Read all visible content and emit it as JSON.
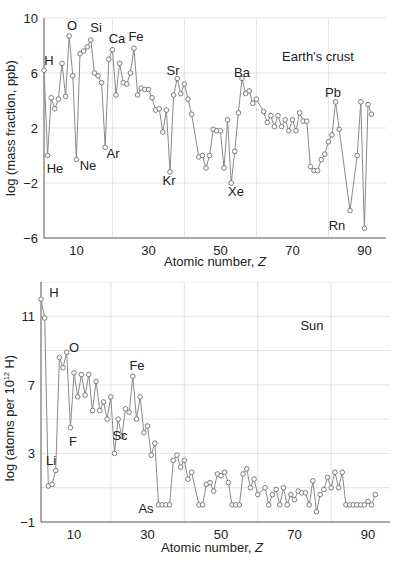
{
  "chart_data": [
    {
      "type": "line",
      "title": "Earth's crust",
      "xlabel": "Atomic number, Z",
      "ylabel": "log (mass fraction, ppb)",
      "xlim": [
        1,
        96
      ],
      "ylim": [
        -6,
        10
      ],
      "xticks": [
        10,
        30,
        50,
        70,
        90
      ],
      "yticks": [
        -6,
        -2,
        2,
        6,
        10
      ],
      "grid": true,
      "annotations": [
        "H",
        "He",
        "O",
        "Ne",
        "Si",
        "Ar",
        "Ca",
        "Fe",
        "Sr",
        "Kr",
        "Ba",
        "Xe",
        "Pb",
        "Rn"
      ],
      "series": [
        {
          "name": "Earth's crust",
          "x": [
            1,
            2,
            3,
            4,
            5,
            6,
            7,
            8,
            9,
            10,
            11,
            12,
            13,
            14,
            15,
            16,
            17,
            18,
            19,
            20,
            21,
            22,
            23,
            24,
            25,
            26,
            27,
            28,
            29,
            30,
            31,
            32,
            33,
            34,
            35,
            36,
            37,
            38,
            39,
            40,
            41,
            42,
            44,
            45,
            46,
            47,
            48,
            49,
            50,
            51,
            52,
            53,
            54,
            55,
            56,
            57,
            58,
            59,
            60,
            62,
            63,
            64,
            65,
            66,
            67,
            68,
            69,
            70,
            71,
            72,
            73,
            74,
            75,
            76,
            77,
            78,
            79,
            80,
            81,
            82,
            83,
            86,
            88,
            89,
            90,
            91,
            92
          ],
          "values": [
            6.2,
            0.0,
            4.2,
            3.4,
            4.1,
            6.7,
            4.3,
            8.7,
            5.8,
            -0.3,
            7.4,
            7.6,
            7.9,
            8.4,
            6.0,
            5.8,
            5.3,
            0.6,
            7.0,
            7.7,
            4.4,
            6.7,
            5.3,
            5.2,
            6.0,
            7.8,
            4.4,
            4.9,
            4.8,
            4.8,
            4.2,
            3.3,
            3.4,
            1.7,
            3.3,
            -1.2,
            4.4,
            5.6,
            4.5,
            5.2,
            4.1,
            3.0,
            -0.1,
            0.0,
            -0.9,
            0.0,
            1.9,
            1.8,
            1.8,
            -0.9,
            2.6,
            -2.0,
            0.3,
            3.1,
            5.6,
            4.5,
            4.7,
            3.8,
            4.1,
            3.2,
            2.4,
            2.9,
            2.1,
            2.9,
            2.1,
            2.6,
            1.8,
            2.6,
            1.8,
            3.1,
            2.5,
            2.5,
            -0.8,
            -1.1,
            -1.1,
            -0.3,
            0.1,
            1.0,
            1.5,
            3.9,
            1.9,
            -4.0,
            0.0,
            3.9,
            -5.3,
            3.7,
            3.0
          ]
        }
      ]
    },
    {
      "type": "line",
      "title": "Sun",
      "xlabel": "Atomic number, Z",
      "ylabel": "log (atoms per 10^12 H)",
      "xlim": [
        1,
        96
      ],
      "ylim": [
        -1,
        13
      ],
      "xticks": [
        10,
        30,
        50,
        70,
        90
      ],
      "yticks": [
        -1,
        3,
        7,
        11
      ],
      "grid": true,
      "annotations": [
        "H",
        "Li",
        "O",
        "F",
        "Fe",
        "Sc",
        "As"
      ],
      "series": [
        {
          "name": "Sun",
          "x": [
            1,
            2,
            3,
            4,
            5,
            6,
            7,
            8,
            9,
            10,
            11,
            12,
            13,
            14,
            15,
            16,
            17,
            18,
            19,
            20,
            21,
            22,
            23,
            24,
            25,
            26,
            27,
            28,
            29,
            30,
            31,
            32,
            33,
            34,
            35,
            36,
            37,
            38,
            39,
            40,
            41,
            42,
            44,
            45,
            46,
            47,
            48,
            49,
            50,
            51,
            52,
            53,
            54,
            55,
            56,
            57,
            58,
            59,
            60,
            62,
            63,
            64,
            65,
            66,
            67,
            68,
            69,
            70,
            71,
            72,
            73,
            74,
            75,
            76,
            77,
            78,
            79,
            80,
            81,
            82,
            83,
            84,
            85,
            86,
            87,
            88,
            89,
            90,
            91,
            92
          ],
          "values": [
            12.0,
            10.9,
            1.1,
            1.2,
            2.0,
            8.6,
            8.0,
            8.9,
            4.5,
            7.7,
            6.3,
            7.6,
            6.4,
            7.6,
            5.5,
            7.2,
            5.5,
            6.0,
            5.0,
            6.3,
            3.0,
            5.0,
            4.0,
            5.6,
            5.4,
            7.5,
            5.0,
            6.3,
            4.2,
            4.6,
            2.9,
            3.6,
            0.0,
            0.0,
            0.0,
            0.0,
            2.6,
            2.9,
            2.2,
            2.6,
            1.5,
            1.9,
            0.0,
            0.0,
            1.2,
            1.3,
            0.8,
            1.8,
            1.7,
            1.9,
            1.3,
            0.0,
            0.0,
            0.0,
            1.8,
            2.1,
            1.0,
            1.5,
            0.6,
            1.0,
            0.0,
            0.6,
            0.9,
            0.0,
            1.0,
            0.0,
            0.6,
            0.3,
            0.8,
            0.7,
            0.7,
            0.0,
            1.4,
            -0.4,
            0.6,
            0.9,
            1.6,
            1.0,
            1.9,
            1.0,
            1.9,
            0.0,
            0.0,
            0.0,
            0.0,
            0.0,
            0.0,
            0.2,
            0.0,
            0.6
          ]
        }
      ]
    }
  ],
  "charts": {
    "crust": {
      "title": "Earth's crust",
      "xlabel": "Atomic number, ",
      "xlabel_var": "Z",
      "ylabel": "log (mass fraction, ppb)",
      "yticks": [
        "10",
        "6",
        "2",
        "−2",
        "−6"
      ],
      "xticks": [
        "10",
        "30",
        "50",
        "70",
        "90"
      ]
    },
    "sun": {
      "title": "Sun",
      "xlabel": "Atomic number, ",
      "xlabel_var": "Z",
      "ylabel_pre": "log (atoms per 10",
      "ylabel_sup": "12",
      "ylabel_post": " H)",
      "yticks": [
        "11",
        "7",
        "3",
        "−1"
      ],
      "xticks": [
        "10",
        "30",
        "50",
        "70",
        "90"
      ]
    }
  }
}
